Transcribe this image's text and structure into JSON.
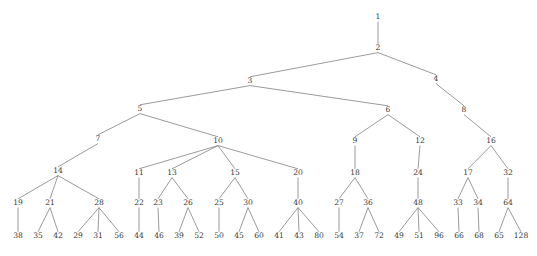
{
  "figure": {
    "kind": "tree-diagram",
    "title": "",
    "background_color": "#ffffff",
    "edge_color": "#6f6f6f",
    "label_color": "#3a3a3a",
    "width": 537,
    "height": 256
  },
  "chart_data": {
    "type": "diagram",
    "subtype": "rooted-tree",
    "title": "",
    "xlabel": "",
    "ylabel": "",
    "grid": false,
    "legend": null,
    "root": "1",
    "depth_levels": 9,
    "node_count": 63,
    "edge_count": 62,
    "nodes": [
      {
        "label": "1",
        "x": 378,
        "y": 19,
        "level": 0
      },
      {
        "label": "2",
        "x": 378,
        "y": 50,
        "level": 1
      },
      {
        "label": "3",
        "x": 250,
        "y": 83,
        "level": 2
      },
      {
        "label": "4",
        "x": 436,
        "y": 81,
        "level": 2
      },
      {
        "label": "5",
        "x": 140,
        "y": 111,
        "level": 3
      },
      {
        "label": "6",
        "x": 388,
        "y": 112,
        "level": 3
      },
      {
        "label": "8",
        "x": 464,
        "y": 112,
        "level": 3
      },
      {
        "label": "7",
        "x": 98,
        "y": 141,
        "level": 4
      },
      {
        "label": "10",
        "x": 218,
        "y": 143,
        "level": 4
      },
      {
        "label": "9",
        "x": 355,
        "y": 143,
        "level": 4
      },
      {
        "label": "12",
        "x": 420,
        "y": 143,
        "level": 4
      },
      {
        "label": "16",
        "x": 491,
        "y": 143,
        "level": 4
      },
      {
        "label": "14",
        "x": 58,
        "y": 173,
        "level": 5
      },
      {
        "label": "11",
        "x": 139,
        "y": 175,
        "level": 5
      },
      {
        "label": "13",
        "x": 172,
        "y": 175,
        "level": 5
      },
      {
        "label": "15",
        "x": 235,
        "y": 175,
        "level": 5
      },
      {
        "label": "20",
        "x": 298,
        "y": 175,
        "level": 5
      },
      {
        "label": "18",
        "x": 355,
        "y": 175,
        "level": 5
      },
      {
        "label": "24",
        "x": 418,
        "y": 175,
        "level": 5
      },
      {
        "label": "17",
        "x": 468,
        "y": 175,
        "level": 5
      },
      {
        "label": "32",
        "x": 508,
        "y": 175,
        "level": 5
      },
      {
        "label": "19",
        "x": 18,
        "y": 205,
        "level": 6
      },
      {
        "label": "21",
        "x": 50,
        "y": 205,
        "level": 6
      },
      {
        "label": "28",
        "x": 99,
        "y": 205,
        "level": 6
      },
      {
        "label": "22",
        "x": 139,
        "y": 205,
        "level": 6
      },
      {
        "label": "23",
        "x": 158,
        "y": 205,
        "level": 6
      },
      {
        "label": "26",
        "x": 188,
        "y": 205,
        "level": 6
      },
      {
        "label": "25",
        "x": 219,
        "y": 205,
        "level": 6
      },
      {
        "label": "30",
        "x": 248,
        "y": 205,
        "level": 6
      },
      {
        "label": "40",
        "x": 298,
        "y": 205,
        "level": 6
      },
      {
        "label": "27",
        "x": 339,
        "y": 205,
        "level": 6
      },
      {
        "label": "36",
        "x": 368,
        "y": 205,
        "level": 6
      },
      {
        "label": "48",
        "x": 418,
        "y": 205,
        "level": 6
      },
      {
        "label": "33",
        "x": 458,
        "y": 205,
        "level": 6
      },
      {
        "label": "34",
        "x": 478,
        "y": 205,
        "level": 6
      },
      {
        "label": "64",
        "x": 508,
        "y": 205,
        "level": 6
      },
      {
        "label": "38",
        "x": 18,
        "y": 238,
        "level": 7
      },
      {
        "label": "35",
        "x": 38,
        "y": 238,
        "level": 7
      },
      {
        "label": "42",
        "x": 58,
        "y": 238,
        "level": 7
      },
      {
        "label": "29",
        "x": 78,
        "y": 238,
        "level": 7
      },
      {
        "label": "31",
        "x": 98,
        "y": 238,
        "level": 7
      },
      {
        "label": "56",
        "x": 119,
        "y": 238,
        "level": 7
      },
      {
        "label": "44",
        "x": 139,
        "y": 238,
        "level": 7
      },
      {
        "label": "46",
        "x": 159,
        "y": 238,
        "level": 7
      },
      {
        "label": "39",
        "x": 179,
        "y": 238,
        "level": 7
      },
      {
        "label": "52",
        "x": 199,
        "y": 238,
        "level": 7
      },
      {
        "label": "50",
        "x": 219,
        "y": 238,
        "level": 7
      },
      {
        "label": "45",
        "x": 239,
        "y": 238,
        "level": 7
      },
      {
        "label": "60",
        "x": 259,
        "y": 238,
        "level": 7
      },
      {
        "label": "41",
        "x": 279,
        "y": 238,
        "level": 7
      },
      {
        "label": "43",
        "x": 299,
        "y": 238,
        "level": 7
      },
      {
        "label": "80",
        "x": 319,
        "y": 238,
        "level": 7
      },
      {
        "label": "54",
        "x": 339,
        "y": 238,
        "level": 7
      },
      {
        "label": "37",
        "x": 359,
        "y": 238,
        "level": 7
      },
      {
        "label": "72",
        "x": 379,
        "y": 238,
        "level": 7
      },
      {
        "label": "49",
        "x": 399,
        "y": 238,
        "level": 7
      },
      {
        "label": "51",
        "x": 419,
        "y": 238,
        "level": 7
      },
      {
        "label": "96",
        "x": 439,
        "y": 238,
        "level": 7
      },
      {
        "label": "66",
        "x": 459,
        "y": 238,
        "level": 7
      },
      {
        "label": "68",
        "x": 479,
        "y": 238,
        "level": 7
      },
      {
        "label": "65",
        "x": 499,
        "y": 238,
        "level": 7
      },
      {
        "label": "128",
        "x": 521,
        "y": 238,
        "level": 7
      }
    ],
    "edges": [
      [
        "1",
        "2"
      ],
      [
        "2",
        "3"
      ],
      [
        "2",
        "4"
      ],
      [
        "3",
        "5"
      ],
      [
        "3",
        "6"
      ],
      [
        "4",
        "8"
      ],
      [
        "5",
        "7"
      ],
      [
        "5",
        "10"
      ],
      [
        "6",
        "9"
      ],
      [
        "6",
        "12"
      ],
      [
        "8",
        "16"
      ],
      [
        "7",
        "14"
      ],
      [
        "10",
        "11"
      ],
      [
        "10",
        "13"
      ],
      [
        "10",
        "15"
      ],
      [
        "10",
        "20"
      ],
      [
        "9",
        "18"
      ],
      [
        "12",
        "24"
      ],
      [
        "16",
        "17"
      ],
      [
        "16",
        "32"
      ],
      [
        "14",
        "19"
      ],
      [
        "14",
        "21"
      ],
      [
        "14",
        "28"
      ],
      [
        "11",
        "22"
      ],
      [
        "13",
        "23"
      ],
      [
        "13",
        "26"
      ],
      [
        "15",
        "25"
      ],
      [
        "15",
        "30"
      ],
      [
        "20",
        "40"
      ],
      [
        "18",
        "27"
      ],
      [
        "18",
        "36"
      ],
      [
        "24",
        "48"
      ],
      [
        "17",
        "33"
      ],
      [
        "17",
        "34"
      ],
      [
        "32",
        "64"
      ],
      [
        "19",
        "38"
      ],
      [
        "21",
        "35"
      ],
      [
        "21",
        "42"
      ],
      [
        "28",
        "29"
      ],
      [
        "28",
        "31"
      ],
      [
        "28",
        "56"
      ],
      [
        "22",
        "44"
      ],
      [
        "23",
        "46"
      ],
      [
        "26",
        "39"
      ],
      [
        "26",
        "52"
      ],
      [
        "25",
        "50"
      ],
      [
        "30",
        "45"
      ],
      [
        "30",
        "60"
      ],
      [
        "40",
        "41"
      ],
      [
        "40",
        "43"
      ],
      [
        "40",
        "80"
      ],
      [
        "27",
        "54"
      ],
      [
        "36",
        "37"
      ],
      [
        "36",
        "72"
      ],
      [
        "48",
        "49"
      ],
      [
        "48",
        "51"
      ],
      [
        "48",
        "96"
      ],
      [
        "33",
        "66"
      ],
      [
        "34",
        "68"
      ],
      [
        "64",
        "65"
      ],
      [
        "64",
        "128"
      ]
    ]
  }
}
